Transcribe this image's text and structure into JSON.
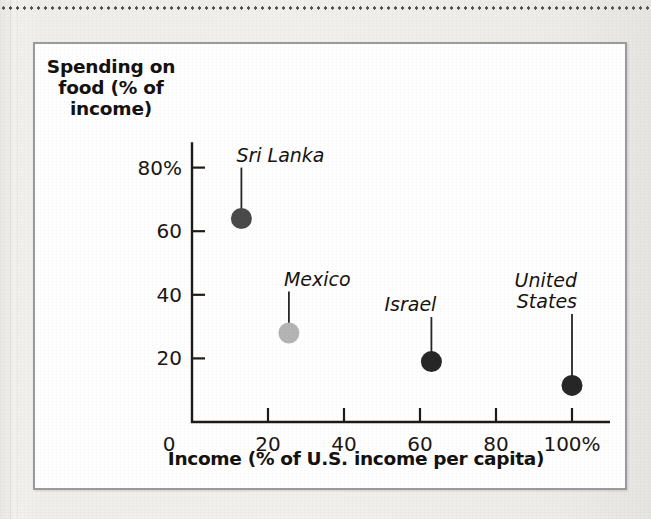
{
  "figure": {
    "y_axis_title_lines": [
      "Spending on",
      "food (% of",
      "income)"
    ],
    "x_axis_title": "Income (% of U.S. income per capita)",
    "border_color": "#9b9b9b",
    "background_color": "#ffffff"
  },
  "chart_data": {
    "type": "scatter",
    "title": "",
    "xlabel": "Income (% of U.S. income per capita)",
    "ylabel": "Spending on food (% of income)",
    "xlim": [
      0,
      110
    ],
    "ylim": [
      0,
      88
    ],
    "grid": false,
    "legend": "none",
    "x_ticks": [
      {
        "value": 0,
        "label": "0"
      },
      {
        "value": 20,
        "label": "20"
      },
      {
        "value": 40,
        "label": "40"
      },
      {
        "value": 60,
        "label": "60"
      },
      {
        "value": 80,
        "label": "80"
      },
      {
        "value": 100,
        "label": "100%"
      }
    ],
    "y_ticks": [
      {
        "value": 20,
        "label": "20"
      },
      {
        "value": 40,
        "label": "40"
      },
      {
        "value": 60,
        "label": "60"
      },
      {
        "value": 80,
        "label": "80%"
      }
    ],
    "points": [
      {
        "name": "Sri Lanka",
        "x": 13,
        "y": 64,
        "color": "#4a4a4a",
        "label": "Sri Lanka",
        "label_lines": [
          "Sri Lanka"
        ],
        "label_anchor": "left",
        "leader_top_y": 80
      },
      {
        "name": "Mexico",
        "x": 25.5,
        "y": 28,
        "color": "#b4b4b4",
        "label": "Mexico",
        "label_lines": [
          "Mexico"
        ],
        "label_anchor": "left",
        "leader_top_y": 41
      },
      {
        "name": "Israel",
        "x": 63,
        "y": 19,
        "color": "#262626",
        "label": "Israel",
        "label_lines": [
          "Israel"
        ],
        "label_anchor": "right",
        "leader_top_y": 33
      },
      {
        "name": "United States",
        "x": 100,
        "y": 11.5,
        "color": "#262626",
        "label": "United States",
        "label_lines": [
          "United",
          "States"
        ],
        "label_anchor": "right",
        "leader_top_y": 34
      }
    ]
  },
  "decor": {
    "top_rule": "dotted-rule",
    "gutter": "page-gutter-line"
  }
}
